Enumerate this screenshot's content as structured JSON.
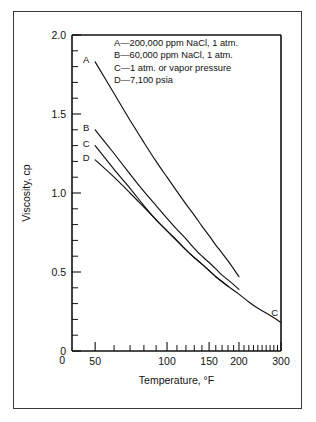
{
  "chart_data": {
    "type": "line",
    "title": "",
    "xlabel": "Temperature, °F",
    "ylabel": "Viscosity, cp",
    "xscale": "log",
    "yscale": "linear",
    "xlim": [
      40,
      300
    ],
    "ylim": [
      0,
      2.0
    ],
    "grid": false,
    "x_tick_labels": [
      "50",
      "100",
      "150",
      "200",
      "300"
    ],
    "x_major_ticks": [
      50,
      100,
      150,
      200,
      300
    ],
    "x_minor_ticks": [
      60,
      70,
      80,
      90,
      110,
      120,
      130,
      140,
      160,
      170,
      180,
      190,
      210,
      220,
      230,
      240,
      250,
      260,
      270,
      280,
      290
    ],
    "y_tick_labels": [
      "0",
      "0.5",
      "1.0",
      "1.5",
      "2.0"
    ],
    "y_major_ticks": [
      0,
      0.5,
      1.0,
      1.5,
      2.0
    ],
    "y_minor_step": 0.1,
    "legend_position": "upper-right-inside",
    "series": [
      {
        "name": "A",
        "legend": "A—200,000 ppm NaCl, 1 atm.",
        "label": "A",
        "x": [
          50,
          60,
          70,
          80,
          90,
          100,
          110,
          120,
          130,
          140,
          150,
          160,
          170,
          180,
          190,
          200
        ],
        "y": [
          1.83,
          1.63,
          1.46,
          1.32,
          1.2,
          1.1,
          1.01,
          0.93,
          0.86,
          0.79,
          0.73,
          0.67,
          0.62,
          0.57,
          0.52,
          0.47
        ]
      },
      {
        "name": "B",
        "legend": "B—60,000 ppm NaCl, 1 atm.",
        "label": "B",
        "x": [
          50,
          60,
          70,
          80,
          90,
          100,
          110,
          120,
          130,
          140,
          150,
          160,
          170,
          180,
          190,
          200
        ],
        "y": [
          1.4,
          1.25,
          1.12,
          1.01,
          0.92,
          0.84,
          0.77,
          0.71,
          0.65,
          0.6,
          0.56,
          0.52,
          0.48,
          0.45,
          0.42,
          0.39
        ]
      },
      {
        "name": "C",
        "legend": "C—1 atm. or vapor pressure",
        "label": "C",
        "x": [
          50,
          60,
          70,
          80,
          90,
          100,
          120,
          140,
          160,
          180,
          200,
          220,
          240,
          260,
          280,
          300
        ],
        "y": [
          1.3,
          1.15,
          1.03,
          0.92,
          0.83,
          0.76,
          0.64,
          0.55,
          0.47,
          0.41,
          0.36,
          0.31,
          0.27,
          0.24,
          0.21,
          0.18
        ]
      },
      {
        "name": "D",
        "legend": "D—7,100 psia",
        "label": "D",
        "x": [
          50,
          60,
          70,
          80,
          90,
          100,
          110,
          120,
          130,
          140,
          150,
          160,
          170,
          180
        ],
        "y": [
          1.21,
          1.1,
          1.0,
          0.91,
          0.83,
          0.76,
          0.7,
          0.64,
          0.59,
          0.55,
          0.51,
          0.47,
          0.44,
          0.41
        ]
      }
    ],
    "endpoint_labels": [
      {
        "text": "C",
        "x": 282,
        "y": 0.22
      }
    ],
    "legend_entries": [
      "A—200,000 ppm NaCl, 1 atm.",
      "B—60,000 ppm NaCl, 1 atm.",
      "C—1 atm. or vapor pressure",
      "D—7,100 psia"
    ]
  }
}
